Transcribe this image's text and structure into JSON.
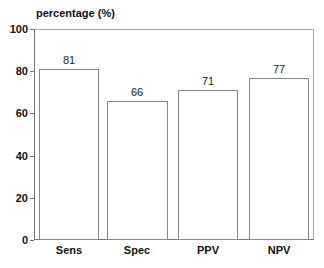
{
  "chart_data": {
    "type": "bar",
    "title": "",
    "ylabel": "percentage (%)",
    "xlabel": "",
    "categories": [
      "Sens",
      "Spec",
      "PPV",
      "NPV"
    ],
    "values": [
      81,
      66,
      71,
      77
    ],
    "value_labels": [
      "81",
      "66",
      "71",
      "77"
    ],
    "ylim": [
      0,
      100
    ],
    "yticks": [
      "0",
      "20",
      "40",
      "60",
      "80",
      "100"
    ],
    "grid": false,
    "legend": null
  }
}
